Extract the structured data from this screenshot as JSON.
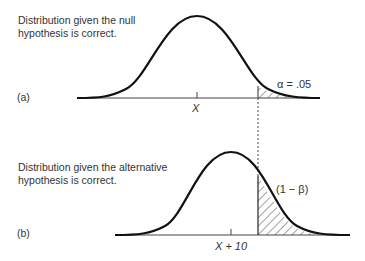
{
  "panel_a": {
    "label": "(a)",
    "caption_line1": "Distribution given the null",
    "caption_line2": "hypothesis is correct.",
    "mean_label": "X",
    "region_label": "α = .05"
  },
  "panel_b": {
    "label": "(b)",
    "caption_line1": "Distribution given the alternative",
    "caption_line2": "hypothesis is correct.",
    "mean_label": "X + 10",
    "region_label": "(1 − β)"
  },
  "colors": {
    "curve": "#111111",
    "axis": "#333333",
    "text": "#333333"
  }
}
